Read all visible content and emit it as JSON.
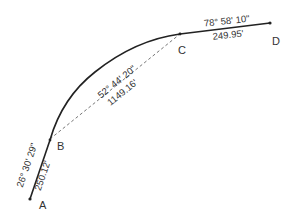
{
  "diagram": {
    "type": "survey-alignment",
    "colors": {
      "line": "#222222",
      "chord": "#666666",
      "text": "#333333",
      "background": "#ffffff"
    },
    "points": [
      {
        "id": "A",
        "label": "A"
      },
      {
        "id": "B",
        "label": "B"
      },
      {
        "id": "C",
        "label": "C"
      },
      {
        "id": "D",
        "label": "D"
      }
    ],
    "segments": {
      "ab": {
        "type": "tangent",
        "angle": "26° 30' 29\"",
        "length": "250.12'"
      },
      "bc": {
        "type": "curve-chord",
        "angle": "52° 44' 20\"",
        "length": "1149.16'"
      },
      "cd": {
        "type": "tangent",
        "angle": "78° 58' 10\"",
        "length": "249.95'"
      }
    }
  }
}
